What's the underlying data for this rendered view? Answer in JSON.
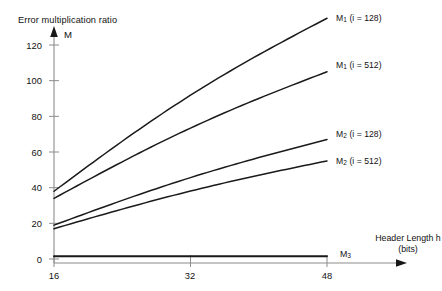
{
  "chart_data": {
    "type": "line",
    "title": "Error multiplication ratio",
    "ylabel": "M",
    "xlabel_line1": "Header Length h",
    "xlabel_line2": "(bits)",
    "xlim": [
      16,
      53
    ],
    "ylim": [
      0,
      132
    ],
    "xticks": [
      16,
      32,
      48
    ],
    "xtick_labels": [
      "16",
      "32",
      "48"
    ],
    "yticks": [
      0,
      20,
      40,
      60,
      80,
      100,
      120
    ],
    "ytick_labels": [
      "0",
      "20",
      "40",
      "60",
      "80",
      "100",
      "120"
    ],
    "grid": false,
    "legend_position": "inline-right-of-curve-ends",
    "axis_color": "#8c8c8c",
    "line_color": "#1a1a1a",
    "x": [
      16,
      48
    ],
    "series": [
      {
        "name": "M1_i128",
        "label_main": "M",
        "label_sub": "1",
        "label_tail": " (i = 128)",
        "values": [
          38,
          135
        ]
      },
      {
        "name": "M1_i512",
        "label_main": "M",
        "label_sub": "1",
        "label_tail": " (i = 512)",
        "values": [
          34,
          105
        ]
      },
      {
        "name": "M2_i128",
        "label_main": "M",
        "label_sub": "2",
        "label_tail": " (i = 128)",
        "values": [
          19,
          67
        ]
      },
      {
        "name": "M2_i512",
        "label_main": "M",
        "label_sub": "2",
        "label_tail": " (i = 512)",
        "values": [
          17,
          55
        ]
      },
      {
        "name": "M3",
        "label_main": "M",
        "label_sub": "3",
        "label_tail": "",
        "values": [
          1.5,
          1.5
        ]
      }
    ]
  },
  "labels": {
    "title": "Error multiplication ratio",
    "y_axis_symbol": "M",
    "x_axis_title_line1": "Header Length h",
    "x_axis_title_line2": "(bits)",
    "ytick_120": "120",
    "ytick_100": "100",
    "ytick_80": "80",
    "ytick_60": "60",
    "ytick_40": "40",
    "ytick_20": "20",
    "ytick_0": "0",
    "xtick_16": "16",
    "xtick_32": "32",
    "xtick_48": "48",
    "series_m1_128_main": "M",
    "series_m1_128_sub": "1",
    "series_m1_128_tail": " (i = 128)",
    "series_m1_512_main": "M",
    "series_m1_512_sub": "1",
    "series_m1_512_tail": " (i = 512)",
    "series_m2_128_main": "M",
    "series_m2_128_sub": "2",
    "series_m2_128_tail": " (i = 128)",
    "series_m2_512_main": "M",
    "series_m2_512_sub": "2",
    "series_m2_512_tail": " (i = 512)",
    "series_m3_main": "M",
    "series_m3_sub": "3"
  }
}
